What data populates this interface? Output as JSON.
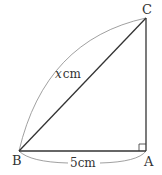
{
  "diagram": {
    "type": "right-triangle",
    "vertices": {
      "A": {
        "label": "A"
      },
      "B": {
        "label": "B"
      },
      "C": {
        "label": "C"
      }
    },
    "right_angle_at": "A",
    "sides": {
      "BC": {
        "label_var": "x",
        "label_unit": "cm",
        "role": "hypotenuse"
      },
      "BA": {
        "label": "5cm",
        "role": "base"
      },
      "AC": {
        "label": "",
        "role": "height"
      }
    },
    "colors": {
      "line": "#333333",
      "arc": "#777777",
      "background": "#ffffff"
    }
  }
}
